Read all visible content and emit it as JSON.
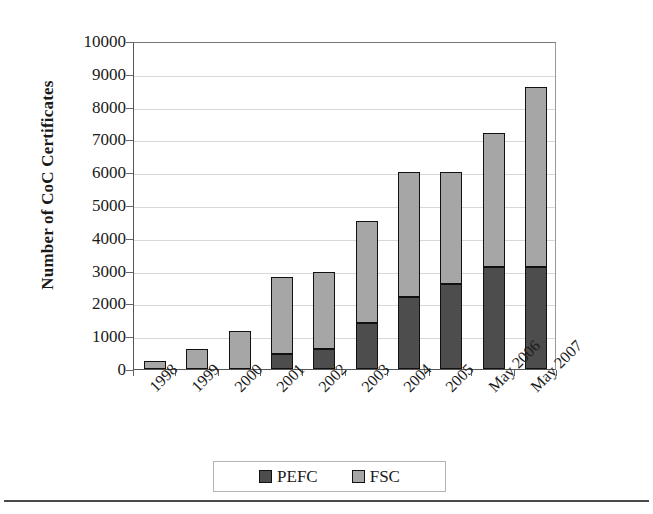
{
  "chart_data": {
    "type": "bar",
    "stacked": true,
    "title": "",
    "xlabel": "",
    "ylabel": "Number of CoC Certificates",
    "ylim": [
      0,
      10000
    ],
    "ytick_step": 1000,
    "yticks": [
      "10000",
      "9000",
      "8000",
      "7000",
      "6000",
      "5000",
      "4000",
      "3000",
      "2000",
      "1000",
      "0"
    ],
    "ytick_values": [
      10000,
      9000,
      8000,
      7000,
      6000,
      5000,
      4000,
      3000,
      2000,
      1000,
      0
    ],
    "grid": true,
    "grid_axis": "y",
    "legend_position": "bottom",
    "categories": [
      "1998",
      "1999",
      "2000",
      "2001",
      "2002",
      "2003",
      "2004",
      "2005",
      "May 2006",
      "May 2007"
    ],
    "series": [
      {
        "name": "PEFC",
        "color": "#4d4d4d",
        "values": [
          0,
          0,
          0,
          450,
          600,
          1400,
          2200,
          2600,
          3100,
          3100
        ]
      },
      {
        "name": "FSC",
        "color": "#a6a6a6",
        "values": [
          250,
          600,
          1150,
          2350,
          2350,
          3100,
          3800,
          3400,
          4100,
          5500
        ]
      }
    ],
    "totals": [
      250,
      600,
      1150,
      2800,
      2950,
      4500,
      6000,
      6000,
      7200,
      8600
    ]
  },
  "legend": {
    "items": [
      {
        "label": "PEFC",
        "color": "#4d4d4d"
      },
      {
        "label": "FSC",
        "color": "#a6a6a6"
      }
    ]
  },
  "axis": {
    "ylabel": "Number of CoC Certificates"
  }
}
